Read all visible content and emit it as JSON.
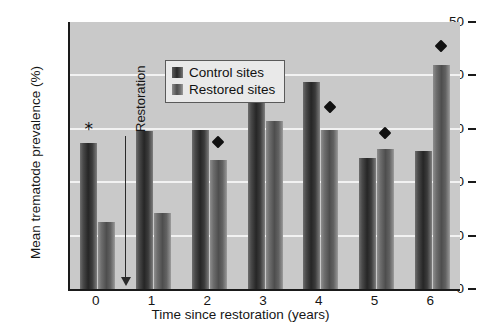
{
  "chart_data": {
    "type": "bar",
    "title": "",
    "xlabel": "Time since restoration (years)",
    "ylabel": "Mean trematode prevalence (%)",
    "categories": [
      "0",
      "1",
      "2",
      "3",
      "4",
      "5",
      "6"
    ],
    "series": [
      {
        "name": "Control sites",
        "values": [
          27.3,
          29.5,
          29.8,
          40.8,
          38.8,
          24.5,
          25.8
        ]
      },
      {
        "name": "Restored sites",
        "values": [
          12.5,
          14.2,
          24.2,
          31.5,
          29.7,
          26.2,
          42.0
        ]
      }
    ],
    "ylim": [
      0,
      50
    ],
    "yticks": [
      0,
      10,
      20,
      30,
      40,
      50
    ],
    "ytick_labels": [
      "0",
      "10",
      "20",
      "30",
      "40",
      "50"
    ],
    "gridlines": [
      10,
      20,
      30,
      40
    ],
    "grid": true,
    "legend_position": "top-left-inside",
    "annotations": [
      {
        "type": "star",
        "label": "*",
        "category": "0",
        "series": "Control sites",
        "value": 30.0
      },
      {
        "type": "diamond",
        "category": "2",
        "series": "Restored sites",
        "value": 27.6
      },
      {
        "type": "diamond",
        "category": "4",
        "series": "Restored sites",
        "value": 34.0
      },
      {
        "type": "diamond",
        "category": "5",
        "series": "Restored sites",
        "value": 29.2
      },
      {
        "type": "diamond",
        "category": "6",
        "series": "Restored sites",
        "value": 45.5
      }
    ],
    "event_marker": {
      "label": "Restoration",
      "position_between": [
        "0",
        "1"
      ],
      "arrow_direction": "down"
    },
    "colors": {
      "plot_background": "#c9c9c9",
      "gridline": "#f2f2f2",
      "axis": "#1a1a1a",
      "control_bar": "#2a2a2a",
      "restored_bar": "#5c5c5c",
      "marker": "#111111",
      "text": "#161616"
    }
  },
  "legend": {
    "items": [
      {
        "label": "Control sites",
        "swatch": "control"
      },
      {
        "label": "Restored sites",
        "swatch": "restored"
      }
    ]
  }
}
